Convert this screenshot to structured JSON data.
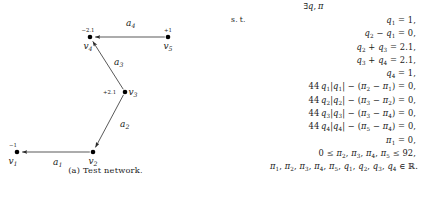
{
  "figure": {
    "caption": "(a) Test network.",
    "nodes": [
      {
        "id": "v1",
        "label": "v",
        "sub": "1",
        "supply": "−1",
        "x": 17,
        "y": 152,
        "name_dx": -4,
        "name_dy": 12,
        "sup_dx": -4,
        "sup_dy": -5
      },
      {
        "id": "v2",
        "label": "v",
        "sub": "2",
        "supply": "",
        "x": 93,
        "y": 152,
        "name_dx": 0,
        "name_dy": 12,
        "sup_dx": 0,
        "sup_dy": -5
      },
      {
        "id": "v3",
        "label": "v",
        "sub": "3",
        "supply": "+2.1",
        "x": 125,
        "y": 92,
        "name_dx": 8,
        "name_dy": 3,
        "sup_dx": -22,
        "sup_dy": 2
      },
      {
        "id": "v4",
        "label": "v",
        "sub": "4",
        "supply": "−2.1",
        "x": 90,
        "y": 37,
        "name_dx": -2,
        "name_dy": 12,
        "sup_dx": -2,
        "sup_dy": -5
      },
      {
        "id": "v5",
        "label": "v",
        "sub": "5",
        "supply": "+1",
        "x": 168,
        "y": 37,
        "name_dx": 0,
        "name_dy": 12,
        "sup_dx": 0,
        "sup_dy": -5
      }
    ],
    "arcs": [
      {
        "id": "a1",
        "label": "a",
        "sub": "1",
        "from": "v2",
        "to": "v1",
        "lx": 53,
        "ly": 165
      },
      {
        "id": "a2",
        "label": "a",
        "sub": "2",
        "from": "v3",
        "to": "v2",
        "lx": 120,
        "ly": 127
      },
      {
        "id": "a3",
        "label": "a",
        "sub": "3",
        "from": "v3",
        "to": "v4",
        "lx": 114,
        "ly": 65
      },
      {
        "id": "a4",
        "label": "a",
        "sub": "4",
        "from": "v5",
        "to": "v4",
        "lx": 126,
        "ly": 26
      }
    ],
    "colors": {
      "node_fill": "#000000",
      "edge_stroke": "#3b3b3b",
      "text": "#1a1a1a"
    }
  },
  "math": {
    "objective_label": "",
    "subject_to_label": "s. t.",
    "rows": [
      {
        "type": "head",
        "label": "",
        "expr_html": "∃<span class=\"it\">q</span>, <span class=\"it\">π</span>"
      },
      {
        "type": "first",
        "label": "s. t.",
        "expr_html": "<span class=\"it\">q</span><sub>1</sub> = 1,"
      },
      {
        "type": "eq",
        "label": "",
        "expr_html": "<span class=\"it\">q</span><sub>2</sub> − <span class=\"it\">q</span><sub>1</sub> = 0,"
      },
      {
        "type": "eq",
        "label": "",
        "expr_html": "<span class=\"it\">q</span><sub>2</sub> + <span class=\"it\">q</span><sub>3</sub> = 2.1,"
      },
      {
        "type": "eq",
        "label": "",
        "expr_html": "<span class=\"it\">q</span><sub>3</sub> + <span class=\"it\">q</span><sub>4</sub> = 2.1,"
      },
      {
        "type": "eq",
        "label": "",
        "expr_html": "<span class=\"it\">q</span><sub>4</sub> = 1,"
      },
      {
        "type": "eq",
        "label": "",
        "expr_html": "44 <span class=\"it\">q</span><sub>1</sub>|<span class=\"it\">q</span><sub>1</sub>| − (<span class=\"it\">π</span><sub>2</sub> − <span class=\"it\">π</span><sub>1</sub>) = 0,"
      },
      {
        "type": "eq",
        "label": "",
        "expr_html": "44 <span class=\"it\">q</span><sub>2</sub>|<span class=\"it\">q</span><sub>2</sub>| − (<span class=\"it\">π</span><sub>3</sub> − <span class=\"it\">π</span><sub>2</sub>) = 0,"
      },
      {
        "type": "eq",
        "label": "",
        "expr_html": "44 <span class=\"it\">q</span><sub>3</sub>|<span class=\"it\">q</span><sub>3</sub>| − (<span class=\"it\">π</span><sub>3</sub> − <span class=\"it\">π</span><sub>4</sub>) = 0,"
      },
      {
        "type": "eq",
        "label": "",
        "expr_html": "44 <span class=\"it\">q</span><sub>4</sub>|<span class=\"it\">q</span><sub>4</sub>| − (<span class=\"it\">π</span><sub>5</sub> − <span class=\"it\">π</span><sub>4</sub>) = 0,"
      },
      {
        "type": "eq",
        "label": "",
        "expr_html": "<span class=\"it\">π</span><sub>1</sub> = 0,"
      },
      {
        "type": "eq",
        "label": "",
        "expr_html": "0 ≤ <span class=\"it\">π</span><sub>2</sub>, <span class=\"it\">π</span><sub>3</sub>, <span class=\"it\">π</span><sub>4</sub>, <span class=\"it\">π</span><sub>5</sub> ≤ 92,"
      },
      {
        "type": "wide",
        "label": "",
        "expr_html": "<span class=\"it\">π</span><sub>1</sub>, <span class=\"it\">π</span><sub>2</sub>, <span class=\"it\">π</span><sub>3</sub>, <span class=\"it\">π</span><sub>4</sub>, <span class=\"it\">π</span><sub>5</sub>, <span class=\"it\">q</span><sub>1</sub>, <span class=\"it\">q</span><sub>2</sub>, <span class=\"it\">q</span><sub>3</sub>, <span class=\"it\">q</span><sub>4</sub> ∈ ℝ."
      }
    ]
  }
}
